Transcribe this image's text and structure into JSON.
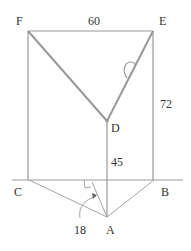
{
  "diagram": {
    "type": "geometry-figure",
    "points": {
      "F": {
        "label": "F",
        "x": 28,
        "y": 31
      },
      "E": {
        "label": "E",
        "x": 153,
        "y": 31
      },
      "D": {
        "label": "D",
        "x": 107,
        "y": 121
      },
      "C": {
        "label": "C",
        "x": 29,
        "y": 180
      },
      "B": {
        "label": "B",
        "x": 154,
        "y": 180
      },
      "A": {
        "label": "A",
        "x": 107,
        "y": 217
      }
    },
    "measurements": {
      "FE": "60",
      "EB": "72",
      "DA": "45",
      "altitude": "18"
    },
    "marks": [
      "right-angle-mark",
      "angle-arc-at-E-D",
      "curved-arrow-to-altitude"
    ]
  }
}
